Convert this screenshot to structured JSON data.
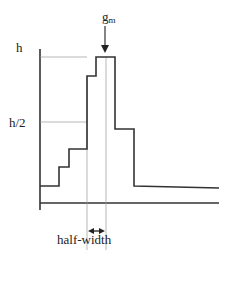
{
  "diagram": {
    "type": "histogram-peak-width-illustration",
    "labels": {
      "peak_height": "h",
      "half_height": "h/2",
      "peak_marker_base": "g",
      "peak_marker_sub": "m",
      "width_label": "half-width"
    },
    "colors": {
      "line": "#333333",
      "guide": "#999999",
      "text": "#222222"
    },
    "histogram_steps": [
      {
        "bin": 1,
        "relative_height": 0.12
      },
      {
        "bin": 2,
        "relative_height": 0.28
      },
      {
        "bin": 3,
        "relative_height": 0.42
      },
      {
        "bin": 4,
        "relative_height": 0.86
      },
      {
        "bin": 5,
        "relative_height": 1.0
      },
      {
        "bin": 6,
        "relative_height": 0.55
      },
      {
        "bin": 7,
        "relative_height": 0.12
      }
    ]
  }
}
